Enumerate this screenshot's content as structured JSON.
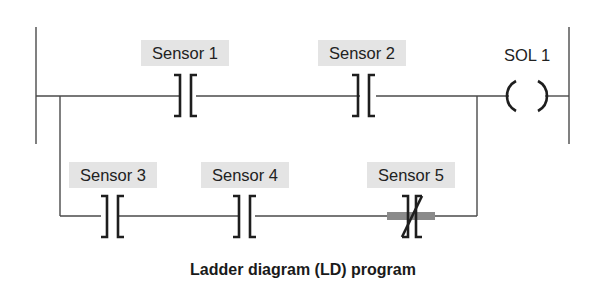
{
  "diagram": {
    "caption": "Ladder diagram (LD) program",
    "coil": {
      "label": "SOL 1",
      "type": "output-coil"
    },
    "rungs": [
      {
        "name": "main",
        "contacts": [
          {
            "label": "Sensor 1",
            "type": "normally-open"
          },
          {
            "label": "Sensor 2",
            "type": "normally-open"
          }
        ]
      },
      {
        "name": "branch",
        "contacts": [
          {
            "label": "Sensor 3",
            "type": "normally-open"
          },
          {
            "label": "Sensor 4",
            "type": "normally-open"
          },
          {
            "label": "Sensor 5",
            "type": "normally-closed",
            "highlighted": true
          }
        ]
      }
    ],
    "colors": {
      "wire": "#4a4a4a",
      "label_background": "#e4e4e4",
      "highlight": "#8a8a8a"
    }
  }
}
